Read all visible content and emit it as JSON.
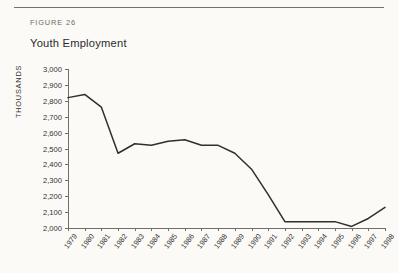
{
  "figure": {
    "label": "FIGURE 26",
    "title": "Youth Employment"
  },
  "chart_data": {
    "type": "line",
    "title": "Youth Employment",
    "xlabel": "",
    "ylabel": "THOUSANDS",
    "ylim": [
      2000,
      3000
    ],
    "ytick_step": 100,
    "grid": false,
    "legend": "none",
    "ytick_labels": [
      "3,000",
      "2,900",
      "2,800",
      "2,700",
      "2,600",
      "2,500",
      "2,400",
      "2,300",
      "2,200",
      "2,100",
      "2,000"
    ],
    "yticks": [
      3000,
      2900,
      2800,
      2700,
      2600,
      2500,
      2400,
      2300,
      2200,
      2100,
      2000
    ],
    "categories": [
      "1979",
      "1980",
      "1981",
      "1982",
      "1983",
      "1984",
      "1985",
      "1986",
      "1987",
      "1988",
      "1989",
      "1990",
      "1991",
      "1992",
      "1993",
      "1994",
      "1995",
      "1996",
      "1997",
      "1998"
    ],
    "values": [
      2820,
      2840,
      2760,
      2470,
      2530,
      2520,
      2545,
      2555,
      2520,
      2520,
      2470,
      2370,
      2210,
      2040,
      2040,
      2040,
      2040,
      2010,
      2060,
      2130
    ],
    "series": [
      {
        "name": "Youth Employment",
        "color": "#2f2f2f",
        "values": [
          2820,
          2840,
          2760,
          2470,
          2530,
          2520,
          2545,
          2555,
          2520,
          2520,
          2470,
          2370,
          2210,
          2040,
          2040,
          2040,
          2040,
          2010,
          2060,
          2130
        ]
      }
    ]
  },
  "colors": {
    "page_background": "#fbfaf7",
    "line": "#2f2f2f",
    "axis": "#6e6e6c",
    "rule": "#6f6f6d",
    "text": "#343434",
    "muted_text": "#6b6b69"
  }
}
